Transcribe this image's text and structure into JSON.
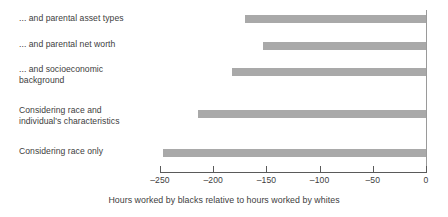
{
  "chart_data": {
    "type": "bar",
    "orientation": "horizontal",
    "title": "",
    "subtitle": "",
    "xlabel": "Hours worked by blacks relative to hours worked by whites",
    "ylabel": "",
    "categories": [
      "... and parental asset types",
      "... and parental net worth",
      "... and socioeconomic\nbackground",
      "Considering race and\nindividual's characteristics",
      "Considering race only"
    ],
    "values": [
      -170,
      -153,
      -182,
      -214,
      -247
    ],
    "xlim": [
      -250,
      0
    ],
    "xticks": [
      -250,
      -200,
      -150,
      -100,
      -50,
      0
    ],
    "xticklabels": [
      "–250",
      "–200",
      "–150",
      "–100",
      "–50",
      "0"
    ],
    "grid": false,
    "legend": null,
    "bar_color": "#a9a9a9",
    "axis_color": "#5a5a5a",
    "text_color": "#404040",
    "background": "#ffffff"
  }
}
